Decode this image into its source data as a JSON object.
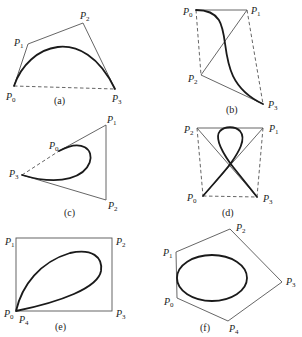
{
  "figure": {
    "panels": [
      {
        "id": "a",
        "caption": "(a)",
        "points": [
          {
            "name": "P",
            "sub": "0"
          },
          {
            "name": "P",
            "sub": "1"
          },
          {
            "name": "P",
            "sub": "2"
          },
          {
            "name": "P",
            "sub": "3"
          }
        ]
      },
      {
        "id": "b",
        "caption": "(b)",
        "points": [
          {
            "name": "P",
            "sub": "0"
          },
          {
            "name": "P",
            "sub": "1"
          },
          {
            "name": "P",
            "sub": "2"
          },
          {
            "name": "P",
            "sub": "3"
          }
        ]
      },
      {
        "id": "c",
        "caption": "(c)",
        "points": [
          {
            "name": "P",
            "sub": "0"
          },
          {
            "name": "P",
            "sub": "1"
          },
          {
            "name": "P",
            "sub": "2"
          },
          {
            "name": "P",
            "sub": "3"
          }
        ]
      },
      {
        "id": "d",
        "caption": "(d)",
        "points": [
          {
            "name": "P",
            "sub": "0"
          },
          {
            "name": "P",
            "sub": "1"
          },
          {
            "name": "P",
            "sub": "2"
          },
          {
            "name": "P",
            "sub": "3"
          }
        ]
      },
      {
        "id": "e",
        "caption": "(e)",
        "points": [
          {
            "name": "P",
            "sub": "0"
          },
          {
            "name": "P",
            "sub": "1"
          },
          {
            "name": "P",
            "sub": "2"
          },
          {
            "name": "P",
            "sub": "3"
          },
          {
            "name": "P",
            "sub": "4"
          }
        ]
      },
      {
        "id": "f",
        "caption": "(f)",
        "points": [
          {
            "name": "P",
            "sub": "0"
          },
          {
            "name": "P",
            "sub": "1"
          },
          {
            "name": "P",
            "sub": "2"
          },
          {
            "name": "P",
            "sub": "3"
          },
          {
            "name": "P",
            "sub": "4"
          }
        ]
      }
    ]
  }
}
